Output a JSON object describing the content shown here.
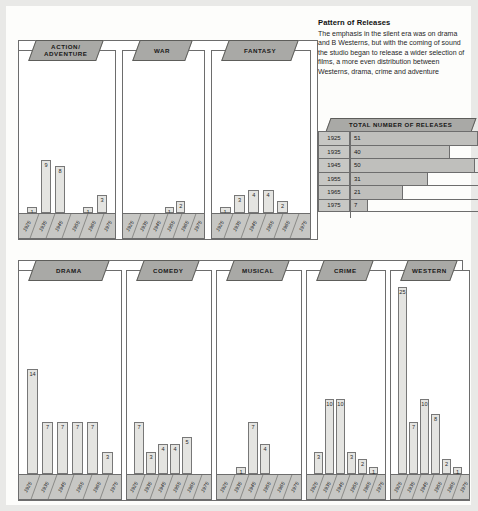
{
  "note": {
    "title": "Pattern of Releases",
    "body": "The emphasis in the silent era was on drama and B Westerns, but with the coming of sound the studio began to release a wider selection of films, a more even distribution between Westerns, drama, crime and adventure"
  },
  "totals": {
    "title": "TOTAL NUMBER OF RELEASES",
    "max": 51,
    "rows": [
      {
        "year": "1925",
        "value": 51
      },
      {
        "year": "1935",
        "value": 40
      },
      {
        "year": "1945",
        "value": 50
      },
      {
        "year": "1955",
        "value": 31
      },
      {
        "year": "1965",
        "value": 21
      },
      {
        "year": "1975",
        "value": 7
      }
    ]
  },
  "chart_data": [
    {
      "type": "bar",
      "title": "ACTION/\nADVENTURE",
      "categories": [
        "1925",
        "1935",
        "1945",
        "1955",
        "1965",
        "1975"
      ],
      "values": [
        1,
        9,
        8,
        0,
        1,
        3
      ],
      "xlabel": "",
      "ylabel": "",
      "ylim": [
        0,
        25
      ]
    },
    {
      "type": "bar",
      "title": "WAR",
      "categories": [
        "1925",
        "1935",
        "1945",
        "1955",
        "1965",
        "1975"
      ],
      "values": [
        0,
        0,
        0,
        1,
        2,
        0
      ],
      "xlabel": "",
      "ylabel": "",
      "ylim": [
        0,
        25
      ]
    },
    {
      "type": "bar",
      "title": "FANTASY",
      "categories": [
        "1925",
        "1935",
        "1945",
        "1955",
        "1965",
        "1975"
      ],
      "values": [
        1,
        3,
        4,
        4,
        2,
        0
      ],
      "xlabel": "",
      "ylabel": "",
      "ylim": [
        0,
        25
      ]
    },
    {
      "type": "bar",
      "title": "DRAMA",
      "categories": [
        "1925",
        "1935",
        "1945",
        "1955",
        "1965",
        "1975"
      ],
      "values": [
        14,
        7,
        7,
        7,
        7,
        3
      ],
      "xlabel": "",
      "ylabel": "",
      "ylim": [
        0,
        25
      ]
    },
    {
      "type": "bar",
      "title": "COMEDY",
      "categories": [
        "1925",
        "1935",
        "1945",
        "1955",
        "1965",
        "1975"
      ],
      "values": [
        7,
        3,
        4,
        4,
        5,
        0
      ],
      "xlabel": "",
      "ylabel": "",
      "ylim": [
        0,
        25
      ]
    },
    {
      "type": "bar",
      "title": "MUSICAL",
      "categories": [
        "1925",
        "1935",
        "1945",
        "1955",
        "1965",
        "1975"
      ],
      "values": [
        0,
        1,
        7,
        4,
        0,
        0
      ],
      "xlabel": "",
      "ylabel": "",
      "ylim": [
        0,
        25
      ]
    },
    {
      "type": "bar",
      "title": "CRIME",
      "categories": [
        "1925",
        "1935",
        "1945",
        "1955",
        "1965",
        "1975"
      ],
      "values": [
        3,
        10,
        10,
        3,
        2,
        1
      ],
      "xlabel": "",
      "ylabel": "",
      "ylim": [
        0,
        25
      ]
    },
    {
      "type": "bar",
      "title": "WESTERN",
      "categories": [
        "1925",
        "1935",
        "1945",
        "1955",
        "1965",
        "1975"
      ],
      "values": [
        25,
        7,
        10,
        8,
        2,
        1
      ],
      "xlabel": "",
      "ylabel": "",
      "ylim": [
        0,
        25
      ]
    }
  ],
  "layout": {
    "top_panels": [
      {
        "index": 0,
        "left": 12,
        "top": 34,
        "width": 98,
        "height": 200
      },
      {
        "index": 1,
        "left": 116,
        "top": 34,
        "width": 83,
        "height": 200
      },
      {
        "index": 2,
        "left": 205,
        "top": 34,
        "width": 100,
        "height": 200
      }
    ],
    "bottom_panels": [
      {
        "index": 3,
        "left": 12,
        "top": 254,
        "width": 104,
        "height": 241
      },
      {
        "index": 4,
        "left": 120,
        "top": 254,
        "width": 86,
        "height": 241
      },
      {
        "index": 5,
        "left": 210,
        "top": 254,
        "width": 86,
        "height": 241
      },
      {
        "index": 6,
        "left": 300,
        "top": 254,
        "width": 80,
        "height": 241
      },
      {
        "index": 7,
        "left": 384,
        "top": 254,
        "width": 80,
        "height": 241
      }
    ]
  },
  "colors": {
    "page_bg": "#e9e9e7",
    "card_bg": "#fdfdfb",
    "tab_fill": "#a9a9a6",
    "bar_fill": "#e4e4e1",
    "axis_fill": "#c7c7c4",
    "stroke": "#6d6d6d"
  }
}
